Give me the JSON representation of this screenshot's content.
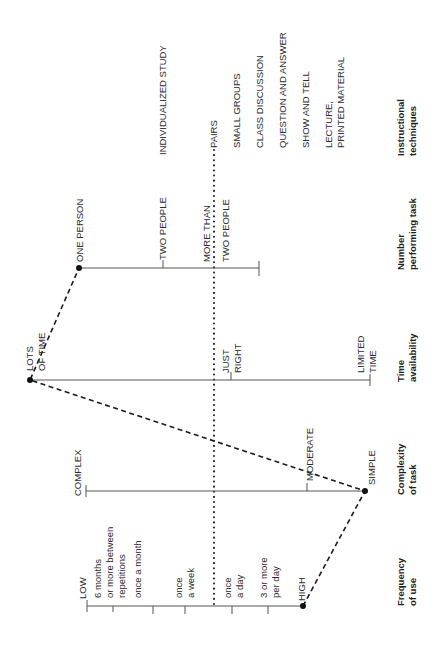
{
  "diagram": {
    "orientation": "rotated 90deg counter-clockwise",
    "axes": [
      {
        "id": "frequency",
        "title": [
          "Frequency",
          "of use"
        ],
        "labels": [
          {
            "text": [
              "LOW"
            ]
          },
          {
            "text": [
              "6 months",
              "or more between",
              "repetitions"
            ]
          },
          {
            "text": [
              "once a month"
            ]
          },
          {
            "text": [
              "once",
              "a week"
            ]
          },
          {
            "text": [
              "once",
              "a day"
            ]
          },
          {
            "text": [
              "3 or more",
              "per day"
            ]
          },
          {
            "text": [
              "HIGH"
            ]
          }
        ],
        "selected": "HIGH"
      },
      {
        "id": "complexity",
        "title": [
          "Complexity",
          "of task"
        ],
        "labels": [
          {
            "text": [
              "COMPLEX"
            ]
          },
          {
            "text": [
              "MODERATE"
            ]
          },
          {
            "text": [
              "SIMPLE"
            ]
          }
        ],
        "selected": "SIMPLE"
      },
      {
        "id": "time",
        "title": [
          "Time",
          "availability"
        ],
        "labels": [
          {
            "text": [
              "LOTS",
              "OF TIME"
            ]
          },
          {
            "text": [
              "JUST",
              "RIGHT"
            ]
          },
          {
            "text": [
              "LIMITED",
              "TIME"
            ]
          }
        ],
        "selected": "LOTS OF TIME"
      },
      {
        "id": "number",
        "title": [
          "Number",
          "performing task"
        ],
        "labels": [
          {
            "text": [
              "ONE PERSON"
            ]
          },
          {
            "text": [
              "TWO PEOPLE"
            ]
          },
          {
            "text": [
              "MORE THAN",
              "TWO PEOPLE"
            ]
          }
        ],
        "selected": "ONE PERSON"
      },
      {
        "id": "techniques",
        "title": [
          "Instructional",
          "techniques"
        ],
        "labels": [
          {
            "text": [
              "INDIVIDUALIZED STUDY"
            ]
          },
          {
            "text": [
              "PAIRS"
            ]
          },
          {
            "text": [
              "SMALL GROUPS"
            ]
          },
          {
            "text": [
              "CLASS DISCUSSION"
            ]
          },
          {
            "text": [
              "QUESTION AND ANSWER"
            ]
          },
          {
            "text": [
              "SHOW AND TELL"
            ]
          },
          {
            "text": [
              "LECTURE,",
              "PRINTED MATERIAL"
            ]
          }
        ]
      }
    ],
    "profile_line": {
      "style": "dashed",
      "path": [
        "HIGH",
        "SIMPLE",
        "LOTS OF TIME",
        "ONE PERSON"
      ]
    },
    "threshold_line": {
      "style": "dotted",
      "position": "between once a week and once a day; at JUST RIGHT; at MORE THAN TWO PEOPLE; at PAIRS"
    }
  }
}
